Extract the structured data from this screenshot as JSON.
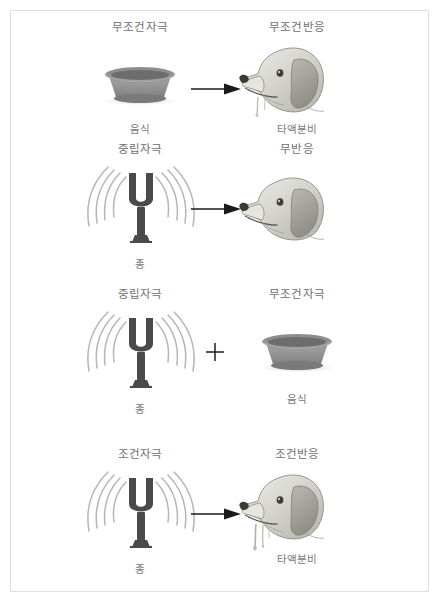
{
  "figure": {
    "border_color": "#dedede",
    "background": "#ffffff",
    "label_color": "#6f6f6f",
    "fork_color": "#4a4a4a",
    "bowl_color": "#8d8d8d",
    "arrow_color": "#1a1a1a"
  },
  "rows": [
    {
      "stimulus_header": "무조건자극",
      "stimulus_caption": "음식",
      "stimulus_icon": "dog-bowl-icon",
      "connector": "arrow-right-icon",
      "response_header": "무조건반응",
      "response_caption": "타액분비",
      "response_icon": "dog-head-salivating-icon"
    },
    {
      "stimulus_header": "중립자극",
      "stimulus_caption": "종",
      "stimulus_icon": "tuning-fork-icon",
      "connector": "arrow-right-icon",
      "response_header": "무반응",
      "response_caption": "",
      "response_icon": "dog-head-icon"
    },
    {
      "stimulus_header": "중립자극",
      "stimulus_caption": "종",
      "stimulus_icon": "tuning-fork-icon",
      "connector": "plus-icon",
      "response_header": "무조건자극",
      "response_caption": "음식",
      "response_icon": "dog-bowl-icon"
    },
    {
      "stimulus_header": "조건자극",
      "stimulus_caption": "종",
      "stimulus_icon": "tuning-fork-icon",
      "connector": "arrow-right-icon",
      "response_header": "조건반응",
      "response_caption": "타액분비",
      "response_icon": "dog-head-salivating-icon"
    }
  ]
}
